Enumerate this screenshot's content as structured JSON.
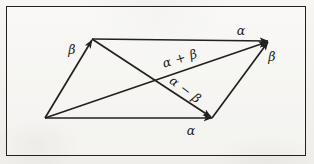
{
  "figure": {
    "background_color": "#f4f3f0",
    "ink_color": "#23211f",
    "frame": {
      "x": 6,
      "y": 6,
      "width": 300,
      "height": 150
    }
  },
  "geometry": {
    "vertices": {
      "origin": {
        "name": "O",
        "x": 45,
        "y": 118
      },
      "bottom_right": {
        "name": "A",
        "x": 212,
        "y": 118
      },
      "top_left": {
        "name": "B",
        "x": 92,
        "y": 39
      },
      "top_right": {
        "name": "C",
        "x": 268,
        "y": 41
      }
    },
    "edges": [
      {
        "name": "alpha-bottom",
        "from": "origin",
        "to": "bottom_right",
        "arrow": true,
        "label": "alpha"
      },
      {
        "name": "alpha-top",
        "from": "top_left",
        "to": "top_right",
        "arrow": true,
        "label": "alpha"
      },
      {
        "name": "beta-left",
        "from": "origin",
        "to": "top_left",
        "arrow": true,
        "label": "beta"
      },
      {
        "name": "beta-right",
        "from": "bottom_right",
        "to": "top_right",
        "arrow": true,
        "label": "beta"
      },
      {
        "name": "alpha-plus-beta",
        "from": "origin",
        "to": "top_right",
        "arrow": true,
        "label": "alpha + beta"
      },
      {
        "name": "alpha-minus-beta",
        "from": "top_left",
        "to": "bottom_right",
        "arrow": true,
        "label": "alpha - beta"
      }
    ]
  },
  "labels": {
    "beta_left": {
      "text": "β",
      "x": 72,
      "y": 50,
      "rotation": 0
    },
    "alpha_top": {
      "text": "α",
      "x": 241,
      "y": 31,
      "rotation": 0
    },
    "beta_right": {
      "text": "β",
      "x": 272,
      "y": 57,
      "rotation": 0
    },
    "alpha_plus_beta": {
      "text": "α + β",
      "x": 180,
      "y": 59,
      "rotation": -17
    },
    "alpha_minus_beta": {
      "text": "α − β",
      "x": 185,
      "y": 90,
      "rotation": 37
    },
    "alpha_bottom": {
      "text": "α",
      "x": 191,
      "y": 131,
      "rotation": 0
    }
  }
}
